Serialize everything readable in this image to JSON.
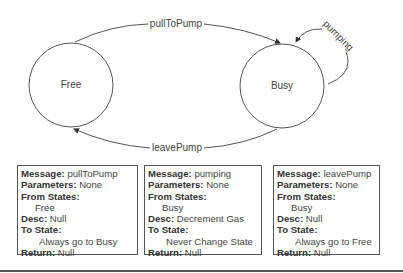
{
  "states": [
    {
      "id": "free",
      "label": "Free"
    },
    {
      "id": "busy",
      "label": "Busy"
    }
  ],
  "transitions": [
    {
      "label": "pullToPump",
      "from": "Free",
      "to": "Busy"
    },
    {
      "label": "pumping",
      "from": "Busy",
      "to": "Busy"
    },
    {
      "label": "leavePump",
      "from": "Busy",
      "to": "Free"
    }
  ],
  "boxes": [
    {
      "message_key": "Message:",
      "message": "pullToPump",
      "parameters_key": "Parameters:",
      "parameters": "None",
      "from_key": "From States:",
      "from": "Free",
      "desc_key": "Desc:",
      "desc": "Null",
      "to_key": "To State:",
      "to": "Always go to Busy",
      "return_key": "Return:",
      "return": "Null"
    },
    {
      "message_key": "Message:",
      "message": "pumping",
      "parameters_key": "Parameters:",
      "parameters": "None",
      "from_key": "From States:",
      "from": "Busy",
      "desc_key": "Desc:",
      "desc": "Decrement Gas",
      "to_key": "To State:",
      "to": "Never Change State",
      "return_key": "Return:",
      "return": "Null"
    },
    {
      "message_key": "Message:",
      "message": "leavePump",
      "parameters_key": "Parameters:",
      "parameters": "None",
      "from_key": "From States:",
      "from": "Busy",
      "desc_key": "Desc:",
      "desc": "Null",
      "to_key": "To State:",
      "to": "Always go to Free",
      "return_key": "Return:",
      "return": "Null"
    }
  ]
}
